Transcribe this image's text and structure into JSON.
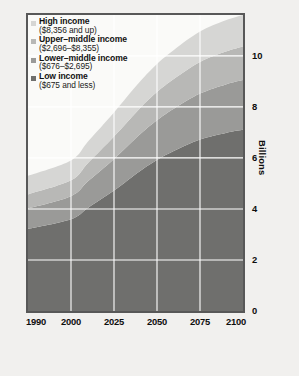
{
  "legend": {
    "position": "top-left-inside",
    "items": [
      {
        "label": "High income",
        "range": "($8,356 and up)",
        "color": "#d6d6d4",
        "swatch_icon": "square-swatch-icon"
      },
      {
        "label": "Upper–middle income",
        "range": "($2,696–$8,355)",
        "color": "#b8b8b6",
        "swatch_icon": "square-swatch-icon"
      },
      {
        "label": "Lower–middle income",
        "range": "($676–$2,695)",
        "color": "#9a9a98",
        "swatch_icon": "square-swatch-icon"
      },
      {
        "label": "Low income",
        "range": "($675 and less)",
        "color": "#6f6f6d",
        "swatch_icon": "square-swatch-icon"
      }
    ]
  },
  "axes": {
    "x_ticks": [
      "1990",
      "2000",
      "2025",
      "2050",
      "2075",
      "2100"
    ],
    "y_ticks": [
      "0",
      "2",
      "4",
      "6",
      "8",
      "10"
    ],
    "y_label": "Billions"
  },
  "chart_data": {
    "type": "area",
    "title": "",
    "subtitle": "",
    "xlabel": "",
    "ylabel": "Billions",
    "stacked": true,
    "grid": true,
    "legend_position": "top-left-inside",
    "xlim": [
      1990,
      2100
    ],
    "ylim": [
      0,
      11.6
    ],
    "x": [
      1990,
      2000,
      2010,
      2025,
      2040,
      2050,
      2060,
      2075,
      2090,
      2100
    ],
    "x_tick_values": [
      1990,
      2000,
      2025,
      2050,
      2075,
      2100
    ],
    "x_tick_positions_frac": [
      0.0,
      0.2,
      0.4,
      0.6,
      0.8,
      1.0
    ],
    "y_tick_values": [
      0,
      2,
      4,
      6,
      8,
      10
    ],
    "series": [
      {
        "name": "Low income",
        "range": "($675 and less)",
        "color": "#6f6f6d",
        "values": [
          3.22,
          3.6,
          4.05,
          4.72,
          5.48,
          5.92,
          6.28,
          6.72,
          6.98,
          7.1
        ]
      },
      {
        "name": "Lower–middle income",
        "range": "($676–$2,695)",
        "color": "#9a9a98",
        "values": [
          0.8,
          0.9,
          1.04,
          1.24,
          1.44,
          1.56,
          1.66,
          1.8,
          1.9,
          1.95
        ]
      },
      {
        "name": "Upper–middle income",
        "range": "($2,696–$8,355)",
        "color": "#b8b8b6",
        "values": [
          0.55,
          0.62,
          0.72,
          0.88,
          1.02,
          1.1,
          1.16,
          1.24,
          1.29,
          1.32
        ]
      },
      {
        "name": "High income",
        "range": "($8,356 and up)",
        "color": "#d6d6d4",
        "values": [
          0.73,
          0.78,
          0.84,
          0.94,
          1.04,
          1.1,
          1.14,
          1.19,
          1.22,
          1.23
        ]
      }
    ],
    "cumulative_totals": [
      5.3,
      5.9,
      6.65,
      7.78,
      8.98,
      9.68,
      10.24,
      10.95,
      11.39,
      11.6
    ],
    "gridline_color": "#ffffff",
    "plot_background": "#fafaf8",
    "frame_color": "#585858"
  }
}
